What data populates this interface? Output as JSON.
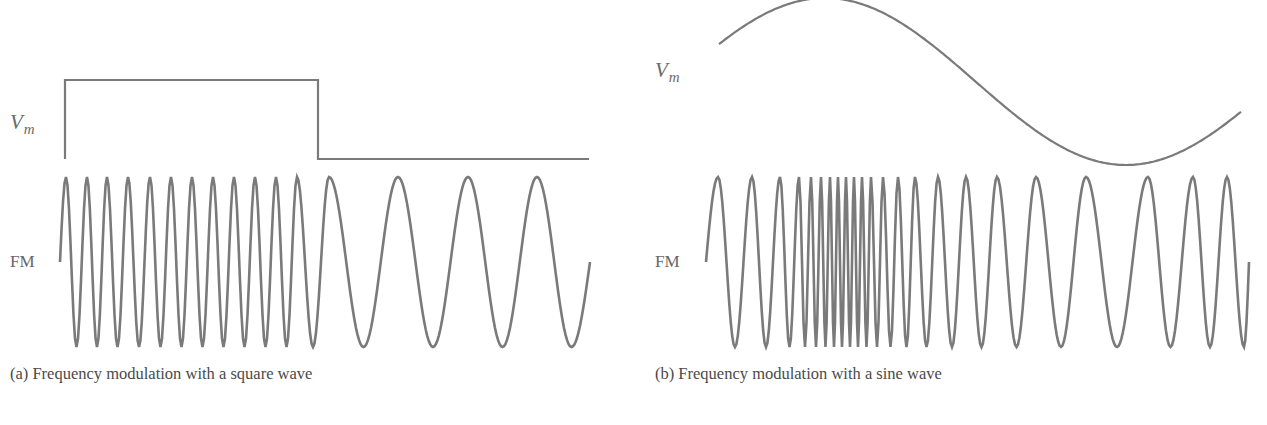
{
  "panels": [
    {
      "id": "a",
      "caption": "(a) Frequency modulation with a square wave",
      "modulator_label": "V",
      "modulator_subscript": "m",
      "carrier_label": "FM",
      "modulator_type": "square",
      "square": {
        "x_start": 65,
        "x_switch": 318,
        "x_end": 589,
        "y_high": 80,
        "y_low": 159,
        "y_start_bottom": 159
      },
      "fm": {
        "x_start": 60,
        "x_end": 590,
        "y_mid": 262,
        "y_top": 177,
        "y_bottom": 347,
        "peaks": [
          66,
          87,
          107,
          128,
          150,
          171,
          192,
          213,
          234,
          255,
          276,
          297,
          329,
          398,
          468,
          537
        ]
      }
    },
    {
      "id": "b",
      "caption": "(b) Frequency modulation with a sine wave",
      "modulator_label": "V",
      "modulator_subscript": "m",
      "carrier_label": "FM",
      "modulator_type": "sine",
      "sine": {
        "x_start": 719,
        "x_end": 1241,
        "x_peak": 825,
        "x_trough": 1126,
        "y_top": -2,
        "y_bottom": 165
      },
      "fm": {
        "x_start": 706,
        "x_end": 1249,
        "y_mid": 262,
        "y_top": 177,
        "y_bottom": 347,
        "peaks": [
          718,
          752,
          780,
          799,
          811,
          821,
          830,
          838,
          846,
          854,
          862,
          871,
          883,
          898,
          915,
          938,
          966,
          997,
          1036,
          1086,
          1148,
          1193,
          1227
        ]
      }
    }
  ],
  "colors": {
    "stroke": "#7a7a7a",
    "text": "#4a4a4a"
  }
}
